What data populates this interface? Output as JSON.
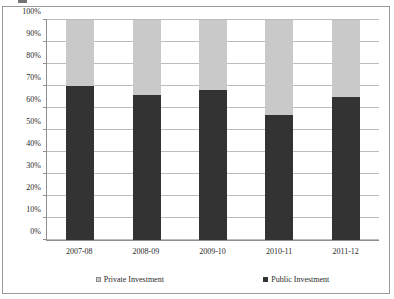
{
  "frame": {
    "border_color": "#9a9a9a",
    "background": "#ffffff"
  },
  "artifact": {
    "name": "cut-off-text-sliver"
  },
  "chart_data": {
    "type": "bar",
    "stacked": true,
    "normalized": true,
    "title": "",
    "subtitle": "",
    "xlabel": "",
    "ylabel": "",
    "categories": [
      "2007-08",
      "2008-09",
      "2009-10",
      "2010-11",
      "2011-12"
    ],
    "series": [
      {
        "name": "Public Investment",
        "color": "#333333",
        "values": [
          70,
          66,
          68,
          57,
          65
        ]
      },
      {
        "name": "Private Investment",
        "color": "#c9c9c9",
        "values": [
          30,
          34,
          32,
          43,
          35
        ]
      }
    ],
    "ylim": [
      0,
      100
    ],
    "ytick_values": [
      0,
      10,
      20,
      30,
      40,
      50,
      60,
      70,
      80,
      90,
      100
    ],
    "ytick_labels": [
      "0%",
      "10%",
      "20%",
      "30%",
      "40%",
      "50%",
      "60%",
      "70%",
      "80%",
      "90%",
      "100%"
    ],
    "grid": true,
    "grid_axis": "y",
    "grid_color": "#bdbdbd",
    "legend_position": "bottom",
    "legend_entries": [
      {
        "label": "Private Investment",
        "color": "#c9c9c9",
        "swatch": "private-swatch"
      },
      {
        "label": "Public Investment",
        "color": "#333333",
        "swatch": "public-swatch"
      }
    ],
    "annotations": []
  }
}
